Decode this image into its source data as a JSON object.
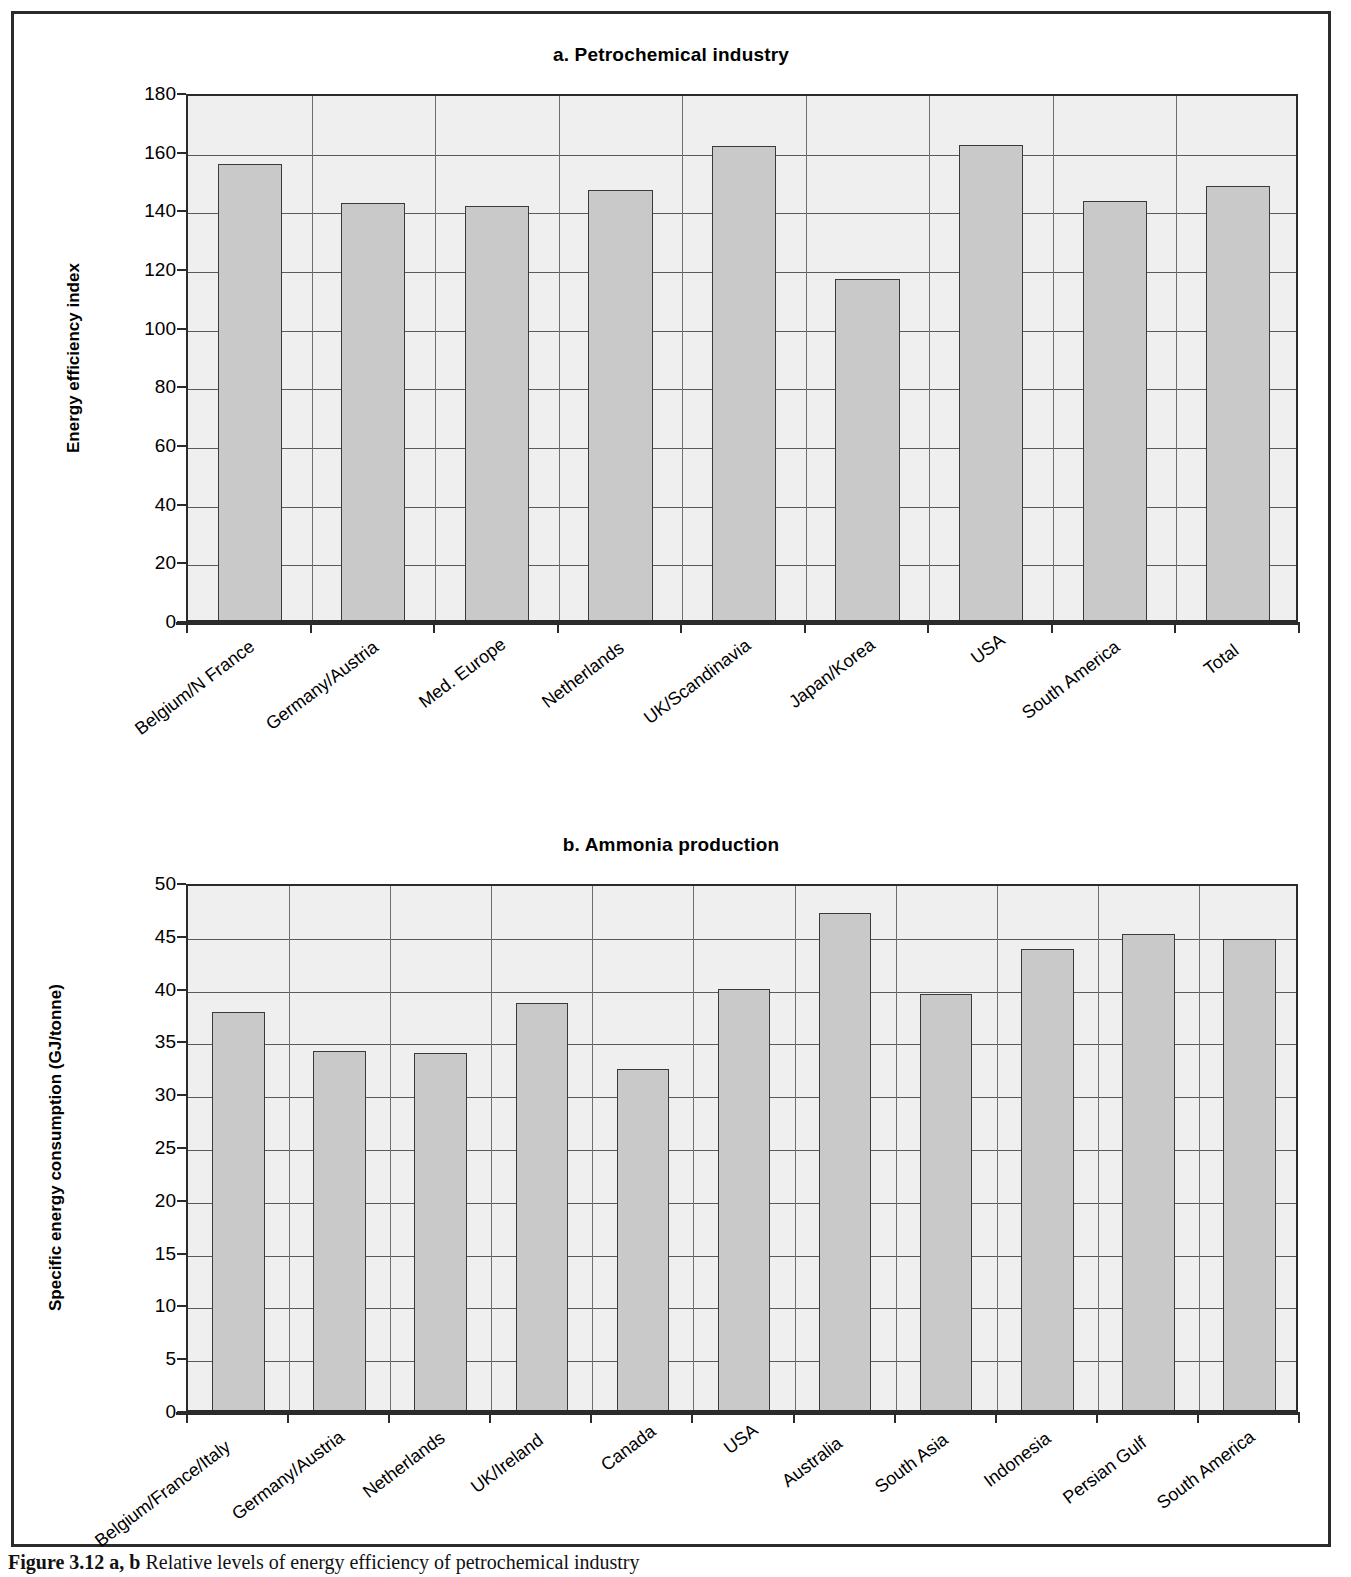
{
  "figure": {
    "caption_label": "Figure 3.12",
    "caption_sublabel": "a, b",
    "caption_text": "Relative levels of energy efficiency of petrochemical industry"
  },
  "chart_data": [
    {
      "type": "bar",
      "panel": "a",
      "title": "a. Petrochemical industry",
      "xlabel": "",
      "ylabel": "Energy efficiency index",
      "ylim": [
        0,
        180
      ],
      "ytick_step": 20,
      "yticks": [
        0,
        20,
        40,
        60,
        80,
        100,
        120,
        140,
        160,
        180
      ],
      "grid": true,
      "legend": "none",
      "bar_color": "#c9c9c9",
      "plot_bg": "#efefef",
      "categories": [
        "Belgium/N France",
        "Germany/Austria",
        "Med. Europe",
        "Netherlands",
        "UK/Scandinavia",
        "Japan/Korea",
        "USA",
        "South America",
        "Total"
      ],
      "values": [
        155.5,
        142.2,
        141.0,
        146.5,
        161.5,
        116.3,
        161.8,
        142.7,
        147.8
      ]
    },
    {
      "type": "bar",
      "panel": "b",
      "title": "b. Ammonia production",
      "xlabel": "",
      "ylabel": "Specific energy consumption (GJ/tonne)",
      "ylim": [
        0,
        50
      ],
      "ytick_step": 5,
      "yticks": [
        0,
        5,
        10,
        15,
        20,
        25,
        30,
        35,
        40,
        45,
        50
      ],
      "grid": true,
      "legend": "none",
      "bar_color": "#c9c9c9",
      "plot_bg": "#efefef",
      "categories": [
        "Belgium/France/Italy",
        "Germany/Austria",
        "Netherlands",
        "UK/Ireland",
        "Canada",
        "USA",
        "Australia",
        "South Asia",
        "Indonesia",
        "Persian Gulf",
        "South America"
      ],
      "values": [
        37.7,
        34.0,
        33.8,
        38.5,
        32.3,
        39.9,
        47.1,
        39.4,
        43.7,
        45.1,
        44.6
      ]
    }
  ]
}
